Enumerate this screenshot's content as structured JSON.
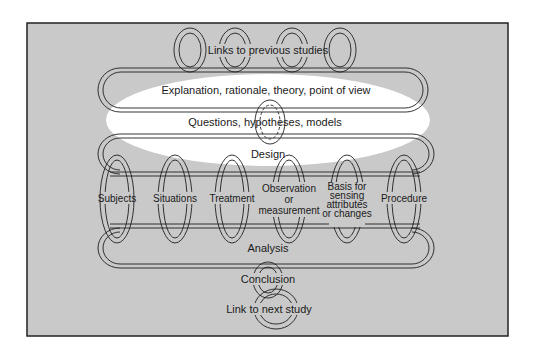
{
  "figure": {
    "frame_bg": "#c9c9c9",
    "frame_border": "#222222",
    "highlight_color": "#ffffff",
    "ring_stroke": "#1f1f1f",
    "ring_fill": "#eeeeee"
  },
  "labels": {
    "previous_studies": "Links to previous studies",
    "explanation": "Explanation, rationale, theory, point of view",
    "questions": "Questions, hypotheses, models",
    "design": "Design",
    "analysis": "Analysis",
    "conclusion": "Conclusion",
    "next_study": "Link to next study"
  },
  "design_elements": [
    {
      "lines": [
        "Subjects"
      ]
    },
    {
      "lines": [
        "Situations"
      ]
    },
    {
      "lines": [
        "Treatment"
      ]
    },
    {
      "lines": [
        "Observation",
        "or",
        "measurement"
      ]
    },
    {
      "lines": [
        "Basis for",
        "sensing",
        "attributes",
        "or changes"
      ]
    },
    {
      "lines": [
        "Procedure"
      ]
    }
  ]
}
